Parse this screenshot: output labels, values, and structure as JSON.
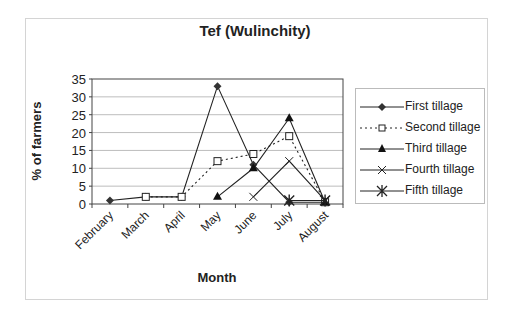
{
  "chart_data": {
    "type": "line",
    "title": "Tef (Wulinchity)",
    "xlabel": "Month",
    "ylabel": "% of farmers",
    "categories": [
      "February",
      "March",
      "April",
      "May",
      "June",
      "July",
      "August"
    ],
    "ylim": [
      0,
      35
    ],
    "yticks": [
      0,
      5,
      10,
      15,
      20,
      25,
      30,
      35
    ],
    "grid": true,
    "legend_position": "right",
    "series": [
      {
        "name": "First tillage",
        "marker": "diamond",
        "line": "solid",
        "values": [
          1,
          2,
          2,
          33,
          11,
          0.5,
          0.5
        ]
      },
      {
        "name": "Second tillage",
        "marker": "open-square",
        "line": "dotted",
        "values": [
          null,
          2,
          2,
          12,
          14,
          19,
          0.5
        ]
      },
      {
        "name": "Third tillage",
        "marker": "triangle",
        "line": "solid",
        "values": [
          null,
          null,
          null,
          2,
          10,
          24,
          0.5
        ]
      },
      {
        "name": "Fourth tillage",
        "marker": "x",
        "line": "solid",
        "values": [
          null,
          null,
          null,
          null,
          2,
          12,
          1
        ]
      },
      {
        "name": "Fifth tillage",
        "marker": "asterisk",
        "line": "solid",
        "values": [
          null,
          null,
          null,
          null,
          null,
          1,
          1
        ]
      }
    ]
  }
}
